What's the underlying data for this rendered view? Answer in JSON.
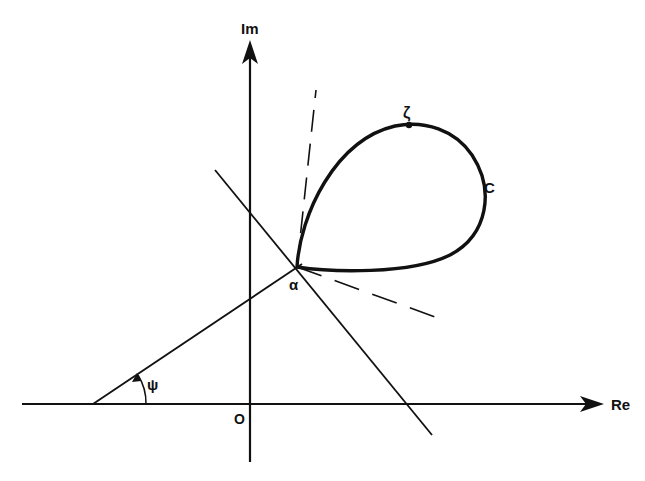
{
  "diagram": {
    "axes": {
      "real_label": "Re",
      "imag_label": "Im",
      "origin_label": "O"
    },
    "points": {
      "alpha_label": "α",
      "zeta_label": "ζ"
    },
    "curve_label": "C",
    "angle_label": "ψ",
    "colors": {
      "ink": "#111111",
      "background": "#ffffff"
    }
  }
}
